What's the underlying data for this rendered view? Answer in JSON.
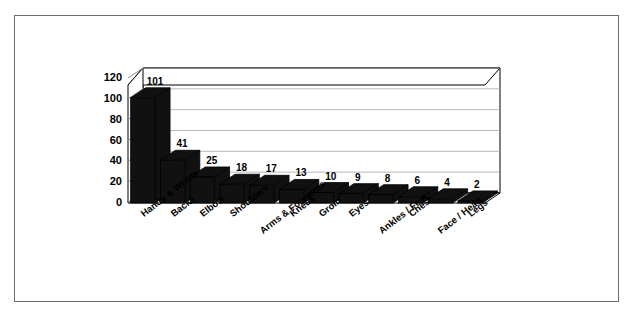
{
  "figure": {
    "border_color": "#6e6e6e",
    "background": "#ffffff"
  },
  "chart_data": {
    "type": "bar",
    "title": "",
    "subtitle": "",
    "xlabel": "",
    "ylabel": "",
    "categories": [
      "Hands & Wrists",
      "Backs",
      "Elbow",
      "Shoulders",
      "Arms & Forearms",
      "Knees",
      "Groin",
      "Eyes",
      "Ankles / Feet",
      "Chest",
      "Face / Head",
      "Legs"
    ],
    "values": [
      101,
      41,
      25,
      18,
      17,
      13,
      10,
      9,
      8,
      6,
      4,
      2
    ],
    "value_labels": [
      "101",
      "41",
      "25",
      "18",
      "17",
      "13",
      "10",
      "9",
      "8",
      "6",
      "4",
      "2"
    ],
    "yticks": [
      0,
      20,
      40,
      60,
      80,
      100,
      120
    ],
    "ytick_labels": [
      "0",
      "20",
      "40",
      "60",
      "80",
      "100",
      "120"
    ],
    "ylim": [
      0,
      120
    ],
    "grid": true,
    "legend": "none",
    "bar_color": "#111111",
    "axis_color": "#000000",
    "grid_color": "#999999",
    "three_d": true
  }
}
